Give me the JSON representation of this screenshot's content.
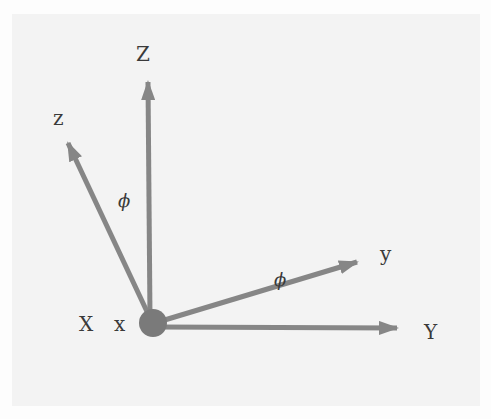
{
  "diagram": {
    "type": "coordinate-frame-rotation",
    "colors": {
      "axis": "#868686",
      "origin": "#7a7a7a",
      "text": "#3a3a3a",
      "panel": "#f3f3f3"
    },
    "labels": {
      "fixed_z": "Z",
      "fixed_y": "Y",
      "fixed_x": "X",
      "rotated_z": "z",
      "rotated_y": "y",
      "rotated_x": "x",
      "angle_zZ": "ϕ",
      "angle_yY": "ϕ"
    },
    "axes": [
      {
        "name": "Z",
        "from": [
          153,
          323
        ],
        "to": [
          148,
          82
        ]
      },
      {
        "name": "Y",
        "from": [
          153,
          323
        ],
        "to": [
          397,
          328
        ]
      },
      {
        "name": "z",
        "from": [
          153,
          323
        ],
        "to": [
          68,
          143
        ]
      },
      {
        "name": "y",
        "from": [
          153,
          323
        ],
        "to": [
          357,
          262
        ]
      }
    ],
    "origin": {
      "x": 153,
      "y": 323,
      "r": 14
    }
  }
}
